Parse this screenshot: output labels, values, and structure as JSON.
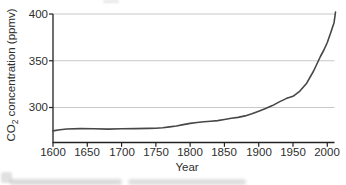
{
  "chart_data": {
    "type": "line",
    "title": "",
    "xlabel": "Year",
    "ylabel": "CO2 concentration (ppmv)",
    "ylabel_parts": {
      "prefix": "CO",
      "sub": "2",
      "suffix": " concentration (ppmv)"
    },
    "x_ticks": [
      1600,
      1650,
      1700,
      1750,
      1800,
      1850,
      1900,
      1950,
      2000
    ],
    "y_ticks": [
      400,
      350,
      300
    ],
    "xlim": [
      1600,
      2012
    ],
    "ylim": [
      262,
      400
    ],
    "grid": "horizontal gridlines at 300, 350, 400",
    "legend": "none",
    "colors": {
      "line": "#474747",
      "grid": "#c8c8c8",
      "axis": "#222222",
      "text": "#2e2e2e",
      "background": "#ffffff"
    },
    "series": [
      {
        "name": "Atmospheric CO2 concentration",
        "x": [
          1600,
          1610,
          1620,
          1640,
          1660,
          1680,
          1700,
          1720,
          1740,
          1750,
          1760,
          1770,
          1780,
          1790,
          1800,
          1810,
          1820,
          1830,
          1840,
          1850,
          1860,
          1870,
          1880,
          1890,
          1900,
          1910,
          1920,
          1930,
          1940,
          1950,
          1960,
          1970,
          1980,
          1990,
          1995,
          2000,
          2005,
          2010,
          2012
        ],
        "y": [
          275,
          276.2,
          277,
          277.4,
          277.2,
          276.9,
          277.2,
          277.4,
          277.6,
          277.9,
          278.4,
          279.2,
          280.2,
          281.7,
          283,
          284,
          284.8,
          285.4,
          286,
          287.2,
          288.4,
          289.4,
          291,
          293.4,
          296,
          298.8,
          302,
          306,
          309.5,
          312,
          317.5,
          326,
          339,
          354.5,
          361.5,
          369.5,
          380,
          391,
          402
        ]
      }
    ]
  }
}
